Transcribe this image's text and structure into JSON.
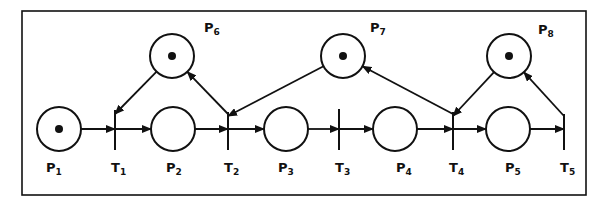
{
  "diagram": {
    "type": "petri-net",
    "colors": {
      "stroke": "#111111",
      "background": "#ffffff"
    },
    "places": [
      {
        "id": "P1",
        "label": "P",
        "sub": "1",
        "cx": 59,
        "cy": 129,
        "token": true,
        "lx": 46,
        "ly": 172
      },
      {
        "id": "P2",
        "label": "P",
        "sub": "2",
        "cx": 173,
        "cy": 129,
        "token": false,
        "lx": 166,
        "ly": 172
      },
      {
        "id": "P3",
        "label": "P",
        "sub": "3",
        "cx": 286,
        "cy": 129,
        "token": false,
        "lx": 278,
        "ly": 172
      },
      {
        "id": "P4",
        "label": "P",
        "sub": "4",
        "cx": 395,
        "cy": 129,
        "token": false,
        "lx": 396,
        "ly": 172
      },
      {
        "id": "P5",
        "label": "P",
        "sub": "5",
        "cx": 508,
        "cy": 129,
        "token": false,
        "lx": 505,
        "ly": 172
      },
      {
        "id": "P6",
        "label": "P",
        "sub": "6",
        "cx": 172,
        "cy": 56,
        "token": true,
        "lx": 204,
        "ly": 32
      },
      {
        "id": "P7",
        "label": "P",
        "sub": "7",
        "cx": 343,
        "cy": 56,
        "token": true,
        "lx": 370,
        "ly": 32
      },
      {
        "id": "P8",
        "label": "P",
        "sub": "8",
        "cx": 509,
        "cy": 56,
        "token": true,
        "lx": 538,
        "ly": 34
      }
    ],
    "transitions": [
      {
        "id": "T1",
        "label": "T",
        "sub": "1",
        "x": 115,
        "y1": 110,
        "y2": 150,
        "lx": 111,
        "ly": 172
      },
      {
        "id": "T2",
        "label": "T",
        "sub": "2",
        "x": 228,
        "y1": 112,
        "y2": 150,
        "lx": 224,
        "ly": 172
      },
      {
        "id": "T3",
        "label": "T",
        "sub": "3",
        "x": 339,
        "y1": 109,
        "y2": 150,
        "lx": 335,
        "ly": 172
      },
      {
        "id": "T4",
        "label": "T",
        "sub": "4",
        "x": 453,
        "y1": 112,
        "y2": 150,
        "lx": 449,
        "ly": 172
      },
      {
        "id": "T5",
        "label": "T",
        "sub": "5",
        "x": 564,
        "y1": 114,
        "y2": 150,
        "lx": 560,
        "ly": 172
      }
    ],
    "arcs": [
      {
        "from": "P1",
        "to": "T1"
      },
      {
        "from": "T1",
        "to": "P2"
      },
      {
        "from": "P2",
        "to": "T2"
      },
      {
        "from": "T2",
        "to": "P3"
      },
      {
        "from": "P3",
        "to": "T3"
      },
      {
        "from": "T3",
        "to": "P4"
      },
      {
        "from": "P4",
        "to": "T4"
      },
      {
        "from": "T4",
        "to": "P5"
      },
      {
        "from": "P5",
        "to": "T5"
      },
      {
        "from": "P6",
        "to": "T1"
      },
      {
        "from": "T2",
        "to": "P6"
      },
      {
        "from": "P7",
        "to": "T2"
      },
      {
        "from": "T4",
        "to": "P7"
      },
      {
        "from": "P8",
        "to": "T4"
      },
      {
        "from": "T5",
        "to": "P8"
      }
    ],
    "frame": {
      "x": 22,
      "y": 11,
      "w": 564,
      "h": 184
    },
    "radius": 22
  }
}
